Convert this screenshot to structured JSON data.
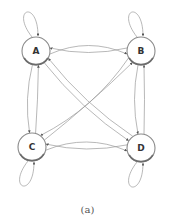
{
  "diagram": {
    "type": "directed-graph",
    "caption": "(a)",
    "nodes": [
      {
        "id": "A",
        "label": "A"
      },
      {
        "id": "B",
        "label": "B"
      },
      {
        "id": "C",
        "label": "C"
      },
      {
        "id": "D",
        "label": "D"
      }
    ],
    "edges": [
      {
        "from": "A",
        "to": "A"
      },
      {
        "from": "B",
        "to": "B"
      },
      {
        "from": "C",
        "to": "C"
      },
      {
        "from": "D",
        "to": "D"
      },
      {
        "from": "A",
        "to": "B"
      },
      {
        "from": "B",
        "to": "A"
      },
      {
        "from": "C",
        "to": "D"
      },
      {
        "from": "D",
        "to": "C"
      },
      {
        "from": "A",
        "to": "C"
      },
      {
        "from": "C",
        "to": "A"
      },
      {
        "from": "B",
        "to": "D"
      },
      {
        "from": "D",
        "to": "B"
      },
      {
        "from": "A",
        "to": "D"
      },
      {
        "from": "D",
        "to": "A"
      },
      {
        "from": "B",
        "to": "C"
      },
      {
        "from": "C",
        "to": "B"
      }
    ]
  }
}
